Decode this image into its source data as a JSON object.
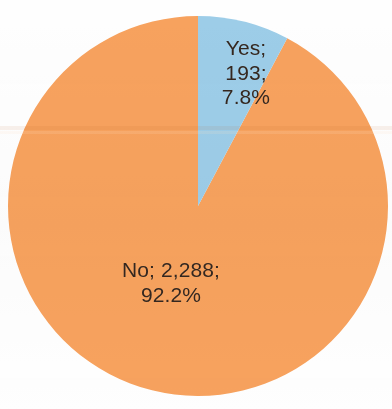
{
  "chart_data": {
    "type": "pie",
    "title": "",
    "subtitle": "",
    "xlabel": "",
    "ylabel": "",
    "legend_position": "none",
    "grid": false,
    "total": 2481,
    "categories": [
      "Yes",
      "No"
    ],
    "values": [
      193,
      2288
    ],
    "percentages": [
      7.8,
      92.2
    ],
    "colors": [
      "#9dcde8",
      "#f7a25e"
    ],
    "start_angle_deg": 0,
    "direction": "clockwise",
    "slices": [
      {
        "name": "Yes",
        "value": 193,
        "value_text": "193",
        "percent": 7.8,
        "percent_text": "7.8%",
        "color": "#9dcde8",
        "label": "Yes;\n193;\n7.8%",
        "start_angle_deg": 0,
        "end_angle_deg": 28.0
      },
      {
        "name": "No",
        "value": 2288,
        "value_text": "2,288",
        "percent": 92.2,
        "percent_text": "92.2%",
        "color": "#f7a25e",
        "label": "No; 2,288;\n92.2%",
        "start_angle_deg": 28.0,
        "end_angle_deg": 360.0
      }
    ]
  },
  "geometry": {
    "center_x": 198,
    "center_y": 206,
    "radius": 190
  },
  "style": {
    "background_color": "#fefefe",
    "label_text_color": "#34271f",
    "slice_yes_color": "#9dcde8",
    "slice_no_color": "#f7a25e"
  }
}
